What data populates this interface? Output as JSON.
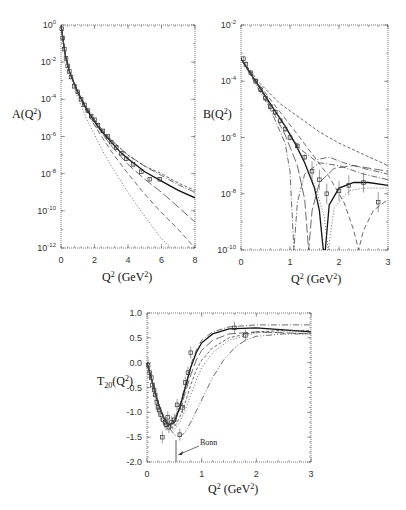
{
  "chart_data": [
    {
      "id": "A",
      "type": "line",
      "title": "",
      "xlabel": "Q² (GeV²)",
      "ylabel": "A(Q²)",
      "yscale": "log",
      "xlim": [
        0,
        8
      ],
      "ylim": [
        1e-12,
        1
      ],
      "xticks": [
        "0",
        "2",
        "4",
        "6",
        "8"
      ],
      "yticks": [
        "10^0",
        "10^-2",
        "10^-4",
        "10^-6",
        "10^-8",
        "10^-10",
        "10^-12"
      ],
      "grid": false,
      "series": [
        {
          "name": "solid",
          "style": "solid",
          "x": [
            0,
            0.25,
            0.5,
            1,
            1.5,
            2,
            2.5,
            3,
            3.5,
            4,
            5,
            6,
            7,
            8
          ],
          "log10y": [
            0,
            -1.6,
            -2.5,
            -3.6,
            -4.5,
            -5.2,
            -5.8,
            -6.3,
            -6.8,
            -7.2,
            -7.9,
            -8.4,
            -8.9,
            -9.3
          ]
        },
        {
          "name": "dash-dot",
          "style": "dashdot",
          "x": [
            0,
            0.25,
            0.5,
            1,
            1.5,
            2,
            2.5,
            3,
            3.5,
            4,
            5,
            6,
            7,
            8
          ],
          "log10y": [
            0,
            -1.6,
            -2.5,
            -3.6,
            -4.4,
            -5.1,
            -5.7,
            -6.2,
            -6.6,
            -7.0,
            -7.6,
            -8.1,
            -8.6,
            -9.0
          ]
        },
        {
          "name": "short-dash",
          "style": "shortdash",
          "x": [
            0,
            0.25,
            0.5,
            1,
            1.5,
            2,
            2.5,
            3,
            3.5,
            4,
            5,
            6,
            7,
            8
          ],
          "log10y": [
            0,
            -1.6,
            -2.5,
            -3.6,
            -4.4,
            -5.1,
            -5.7,
            -6.2,
            -6.6,
            -7.0,
            -7.6,
            -8.0,
            -8.5,
            -8.9
          ]
        },
        {
          "name": "long-dash",
          "style": "longdash",
          "x": [
            0,
            0.25,
            0.5,
            1,
            1.5,
            2,
            2.5,
            3,
            3.5,
            4,
            5,
            6,
            7,
            8
          ],
          "log10y": [
            0,
            -1.6,
            -2.5,
            -3.6,
            -4.5,
            -5.2,
            -5.9,
            -6.5,
            -7.0,
            -7.5,
            -8.3,
            -9.0,
            -9.8,
            -10.6
          ]
        },
        {
          "name": "medium-dash",
          "style": "dash",
          "x": [
            0,
            0.25,
            0.5,
            1,
            1.5,
            2,
            2.5,
            3,
            3.5,
            4,
            5,
            6,
            7,
            8
          ],
          "log10y": [
            0,
            -1.6,
            -2.5,
            -3.7,
            -4.6,
            -5.4,
            -6.1,
            -6.8,
            -7.4,
            -8.0,
            -9.1,
            -10.1,
            -11.0,
            -12.0
          ]
        },
        {
          "name": "dotted-steep",
          "style": "dotted",
          "x": [
            0,
            0.25,
            0.5,
            1,
            1.5,
            2,
            2.5,
            3,
            3.5,
            4,
            5,
            6,
            6.6
          ],
          "log10y": [
            0,
            -1.7,
            -2.6,
            -3.9,
            -5.0,
            -5.9,
            -6.8,
            -7.6,
            -8.3,
            -9.0,
            -10.3,
            -11.5,
            -12.0
          ]
        }
      ],
      "data_points": {
        "x": [
          0.05,
          0.1,
          0.2,
          0.3,
          0.4,
          0.5,
          0.6,
          0.8,
          1.0,
          1.2,
          1.4,
          1.6,
          1.8,
          2.0,
          2.2,
          2.5,
          2.8,
          3.0,
          3.3,
          3.6,
          3.9,
          4.3,
          4.8,
          5.3,
          5.9
        ],
        "log10y": [
          -0.2,
          -0.7,
          -1.3,
          -1.8,
          -2.2,
          -2.5,
          -2.8,
          -3.3,
          -3.6,
          -4.0,
          -4.3,
          -4.6,
          -4.9,
          -5.1,
          -5.4,
          -5.7,
          -6.0,
          -6.3,
          -6.6,
          -6.9,
          -7.2,
          -7.5,
          -7.9,
          -8.3,
          -8.3
        ]
      }
    },
    {
      "id": "B",
      "type": "line",
      "title": "",
      "xlabel": "Q² (GeV²)",
      "ylabel": "B(Q²)",
      "yscale": "log",
      "xlim": [
        0,
        3
      ],
      "ylim": [
        1e-10,
        0.01
      ],
      "xticks": [
        "0",
        "1",
        "2",
        "3"
      ],
      "yticks": [
        "10^-2",
        "10^-4",
        "10^-6",
        "10^-8",
        "10^-10"
      ],
      "grid": false,
      "series": [
        {
          "name": "solid",
          "style": "solid",
          "x": [
            0,
            0.3,
            0.6,
            0.9,
            1.1,
            1.3,
            1.5,
            1.6,
            1.68,
            1.72,
            1.8,
            2.0,
            2.3,
            2.6,
            3.0
          ],
          "log10y": [
            -3.2,
            -4.0,
            -4.8,
            -5.6,
            -6.2,
            -6.9,
            -7.8,
            -8.6,
            -10,
            -10,
            -8.4,
            -7.8,
            -7.6,
            -7.6,
            -7.7
          ]
        },
        {
          "name": "dotted",
          "style": "dotted",
          "x": [
            0,
            0.3,
            0.6,
            0.9,
            1.1,
            1.3,
            1.5,
            1.7,
            1.78,
            1.9,
            2.2,
            2.5,
            3.0
          ],
          "log10y": [
            -3.2,
            -4.0,
            -4.8,
            -5.6,
            -6.2,
            -6.9,
            -7.7,
            -8.8,
            -10,
            -8.5,
            -7.9,
            -7.8,
            -7.8
          ]
        },
        {
          "name": "short-dash-top",
          "style": "shortdash",
          "x": [
            0,
            0.4,
            0.8,
            1.2,
            1.6,
            2.0,
            2.5,
            3.0
          ],
          "log10y": [
            -3.2,
            -4.1,
            -4.8,
            -5.3,
            -5.8,
            -6.2,
            -6.6,
            -7.0
          ]
        },
        {
          "name": "dash-dot-mid",
          "style": "dashdot",
          "x": [
            0,
            0.3,
            0.6,
            0.9,
            1.2,
            1.5,
            1.8,
            2.1,
            2.5,
            3.0
          ],
          "log10y": [
            -3.2,
            -4.0,
            -4.8,
            -5.6,
            -6.4,
            -6.8,
            -6.7,
            -6.9,
            -7.1,
            -7.3
          ]
        },
        {
          "name": "dash-dot-dip",
          "style": "dashdot",
          "x": [
            0,
            0.3,
            0.6,
            0.9,
            1.0,
            1.08,
            1.15,
            1.3,
            1.6,
            2.0,
            2.5,
            3.0
          ],
          "log10y": [
            -3.2,
            -4.1,
            -5.0,
            -6.2,
            -7.2,
            -10,
            -8.3,
            -7.3,
            -6.9,
            -7.0,
            -7.3,
            -7.5
          ]
        },
        {
          "name": "long-dash",
          "style": "longdash",
          "x": [
            0,
            0.3,
            0.6,
            0.9,
            1.15,
            1.3,
            1.38,
            1.45,
            1.6,
            1.9,
            2.3,
            3.0
          ],
          "log10y": [
            -3.2,
            -4.0,
            -4.9,
            -5.9,
            -7.0,
            -8.2,
            -10,
            -8.6,
            -7.6,
            -7.1,
            -7.0,
            -7.2
          ]
        },
        {
          "name": "dash-far-dip",
          "style": "dash",
          "x": [
            0,
            0.4,
            0.8,
            1.2,
            1.5,
            1.8,
            2.1,
            2.3,
            2.4,
            2.5,
            2.7,
            3.0
          ],
          "log10y": [
            -3.2,
            -4.2,
            -5.1,
            -6.0,
            -6.7,
            -7.4,
            -8.3,
            -9.3,
            -10,
            -9.3,
            -8.6,
            -8.2
          ]
        }
      ],
      "data_points": {
        "x": [
          0.05,
          0.1,
          0.2,
          0.3,
          0.4,
          0.5,
          0.6,
          0.7,
          0.8,
          0.9,
          1.0,
          1.15,
          1.3,
          1.45,
          1.6,
          1.75,
          2.0,
          2.2,
          2.5,
          2.8
        ],
        "log10y": [
          -3.2,
          -3.4,
          -3.7,
          -4.0,
          -4.3,
          -4.6,
          -4.9,
          -5.1,
          -5.4,
          -5.7,
          -6.0,
          -6.3,
          -6.7,
          -7.2,
          -7.5,
          -8.0,
          -7.9,
          -7.7,
          -7.6,
          -8.3
        ]
      }
    },
    {
      "id": "T20",
      "type": "line",
      "title": "",
      "xlabel": "Q² (GeV²)",
      "ylabel": "T20(Q²)",
      "yscale": "linear",
      "xlim": [
        0,
        3
      ],
      "ylim": [
        -2.0,
        1.0
      ],
      "xticks": [
        "0",
        "1",
        "2",
        "3"
      ],
      "yticks": [
        "1.0",
        "0.5",
        "0.0",
        "-0.5",
        "-1.0",
        "-1.5",
        "-2.0"
      ],
      "grid": false,
      "annotations": [
        {
          "text": "Bonn",
          "x": 0.9,
          "y": -1.55,
          "arrow_to": [
            0.52,
            -1.8
          ]
        }
      ],
      "series": [
        {
          "name": "solid",
          "style": "solid",
          "x": [
            0,
            0.1,
            0.2,
            0.3,
            0.4,
            0.5,
            0.6,
            0.7,
            0.8,
            0.9,
            1.0,
            1.2,
            1.5,
            2.0,
            2.5,
            3.0
          ],
          "y": [
            0,
            -0.4,
            -0.8,
            -1.1,
            -1.25,
            -1.2,
            -0.9,
            -0.5,
            -0.1,
            0.2,
            0.4,
            0.58,
            0.68,
            0.7,
            0.66,
            0.62
          ]
        },
        {
          "name": "dash-dot",
          "style": "dashdot",
          "x": [
            0,
            0.1,
            0.2,
            0.3,
            0.4,
            0.5,
            0.6,
            0.7,
            0.8,
            0.9,
            1.0,
            1.2,
            1.5,
            2.0,
            2.5,
            3.0
          ],
          "y": [
            0,
            -0.4,
            -0.8,
            -1.1,
            -1.25,
            -1.15,
            -0.85,
            -0.45,
            -0.05,
            0.25,
            0.45,
            0.62,
            0.72,
            0.76,
            0.76,
            0.76
          ]
        },
        {
          "name": "long-dash",
          "style": "longdash",
          "x": [
            0,
            0.1,
            0.2,
            0.3,
            0.4,
            0.5,
            0.6,
            0.7,
            0.8,
            0.9,
            1.0,
            1.2,
            1.5,
            2.0,
            2.5,
            3.0
          ],
          "y": [
            0,
            -0.4,
            -0.8,
            -1.1,
            -1.25,
            -1.2,
            -0.95,
            -0.6,
            -0.25,
            0.05,
            0.25,
            0.45,
            0.58,
            0.62,
            0.6,
            0.58
          ]
        },
        {
          "name": "short-dash",
          "style": "shortdash",
          "x": [
            0,
            0.1,
            0.2,
            0.3,
            0.4,
            0.5,
            0.6,
            0.7,
            0.8,
            0.9,
            1.0,
            1.2,
            1.5,
            2.0,
            2.5,
            3.0
          ],
          "y": [
            0,
            -0.4,
            -0.8,
            -1.1,
            -1.3,
            -1.3,
            -1.1,
            -0.8,
            -0.45,
            -0.15,
            0.05,
            0.3,
            0.5,
            0.62,
            0.65,
            0.65
          ]
        },
        {
          "name": "dotted",
          "style": "dotted",
          "x": [
            0,
            0.1,
            0.2,
            0.3,
            0.4,
            0.5,
            0.6,
            0.7,
            0.8,
            0.9,
            1.0,
            1.2,
            1.5,
            2.0,
            2.5,
            3.0
          ],
          "y": [
            0,
            -0.4,
            -0.8,
            -1.1,
            -1.3,
            -1.35,
            -1.2,
            -0.95,
            -0.65,
            -0.35,
            -0.1,
            0.2,
            0.45,
            0.6,
            0.62,
            0.62
          ]
        },
        {
          "name": "dash-dot-dot",
          "style": "dashdotdot",
          "x": [
            0,
            0.1,
            0.2,
            0.3,
            0.4,
            0.5,
            0.6,
            0.7,
            0.8,
            1.0,
            1.2,
            1.4,
            1.6,
            1.8,
            2.0,
            2.5,
            3.0
          ],
          "y": [
            0,
            -0.4,
            -0.8,
            -1.1,
            -1.3,
            -1.45,
            -1.5,
            -1.4,
            -1.2,
            -0.75,
            -0.3,
            0.05,
            0.3,
            0.45,
            0.53,
            0.58,
            0.58
          ]
        }
      ],
      "data_points": {
        "x": [
          0.02,
          0.05,
          0.08,
          0.1,
          0.13,
          0.15,
          0.18,
          0.2,
          0.22,
          0.25,
          0.28,
          0.3,
          0.33,
          0.35,
          0.38,
          0.4,
          0.45,
          0.5,
          0.55,
          0.6,
          0.65,
          0.7,
          0.75,
          0.8,
          1.6,
          1.8
        ],
        "y": [
          -0.05,
          -0.2,
          -0.3,
          -0.45,
          -0.55,
          -0.65,
          -0.8,
          -0.9,
          -0.95,
          -1.05,
          -1.5,
          -1.15,
          -1.2,
          -1.25,
          -1.1,
          -1.3,
          -1.2,
          -1.15,
          -0.85,
          -1.45,
          -0.9,
          -0.4,
          -0.2,
          0.2,
          0.7,
          0.55
        ]
      }
    }
  ]
}
